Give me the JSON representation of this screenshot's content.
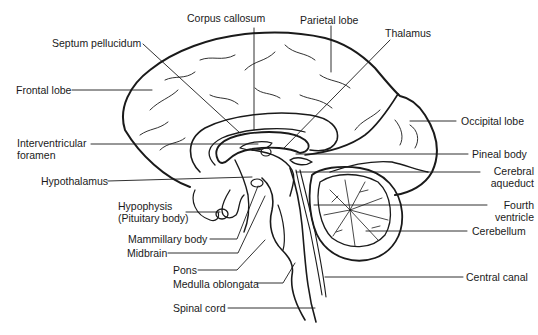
{
  "diagram": {
    "stroke_color": "#1a1a1a",
    "background": "#ffffff",
    "labels": {
      "corpus_callosum": "Corpus callosum",
      "parietal_lobe": "Parietal lobe",
      "septum_pellucidum": "Septum pellucidum",
      "thalamus": "Thalamus",
      "frontal_lobe": "Frontal lobe",
      "occipital_lobe": "Occipital lobe",
      "interventricular_foramen_1": "Interventricular",
      "interventricular_foramen_2": "foramen",
      "pineal_body": "Pineal body",
      "hypothalamus": "Hypothalamus",
      "cerebral_aqueduct_1": "Cerebral",
      "cerebral_aqueduct_2": "aqueduct",
      "hypophysis_1": "Hypophysis",
      "hypophysis_2": "(Pituitary body)",
      "fourth_ventricle_1": "Fourth",
      "fourth_ventricle_2": "ventricle",
      "mammillary_body": "Mammillary body",
      "cerebellum": "Cerebellum",
      "midbrain": "Midbrain",
      "pons": "Pons",
      "central_canal": "Central canal",
      "medulla_oblongata": "Medulla oblongata",
      "spinal_cord": "Spinal cord"
    }
  }
}
